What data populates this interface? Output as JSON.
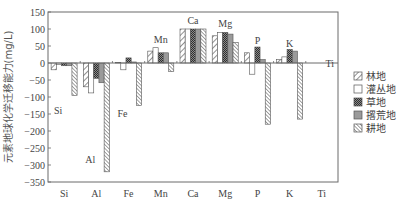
{
  "chart_data": {
    "type": "bar",
    "title": "",
    "xlabel": "",
    "ylabel": "元素地球化学迁移能力(mg/L)",
    "ylim": [
      -350,
      150
    ],
    "yticks": [
      150,
      100,
      50,
      0,
      -50,
      -100,
      -150,
      -200,
      -250,
      -300,
      -350
    ],
    "grid": false,
    "legend_position": "right",
    "categories": [
      "Si",
      "Al",
      "Fe",
      "Mn",
      "Ca",
      "Mg",
      "P",
      "K",
      "Ti"
    ],
    "series": [
      {
        "name": "林地",
        "pattern": "diag-sparse",
        "values": [
          -20,
          -70,
          2,
          35,
          100,
          80,
          30,
          10,
          0
        ]
      },
      {
        "name": "灌丛地",
        "pattern": "empty",
        "values": [
          -5,
          -88,
          -20,
          45,
          100,
          90,
          -33,
          18,
          0
        ]
      },
      {
        "name": "草地",
        "pattern": "checker-dark",
        "values": [
          -8,
          -45,
          15,
          30,
          100,
          90,
          47,
          40,
          0
        ]
      },
      {
        "name": "撂荒地",
        "pattern": "gray",
        "values": [
          -8,
          -58,
          3,
          30,
          100,
          85,
          10,
          35,
          0
        ]
      },
      {
        "name": "耕地",
        "pattern": "diag-dense",
        "values": [
          -95,
          -320,
          -125,
          -25,
          100,
          60,
          -180,
          -165,
          0
        ]
      }
    ],
    "annotations": [
      {
        "text": "Si",
        "category": "Si",
        "y": -150
      },
      {
        "text": "Al",
        "category": "Al",
        "y": -295
      },
      {
        "text": "Fe",
        "category": "Fe",
        "y": -160
      },
      {
        "text": "Mn",
        "category": "Mn",
        "y": 60
      },
      {
        "text": "Ca",
        "category": "Ca",
        "y": 115
      },
      {
        "text": "Mg",
        "category": "Mg",
        "y": 105
      },
      {
        "text": "P",
        "category": "P",
        "y": 55
      },
      {
        "text": "K",
        "category": "K",
        "y": 48
      },
      {
        "text": "Ti",
        "category": "Ti",
        "y": -12
      }
    ]
  },
  "colors": {
    "axis": "#6b6b6b",
    "bar_stroke": "#555555",
    "gray_fill": "#9a9a9a",
    "checker_dark": "#3f3f3f",
    "text": "#444444"
  }
}
